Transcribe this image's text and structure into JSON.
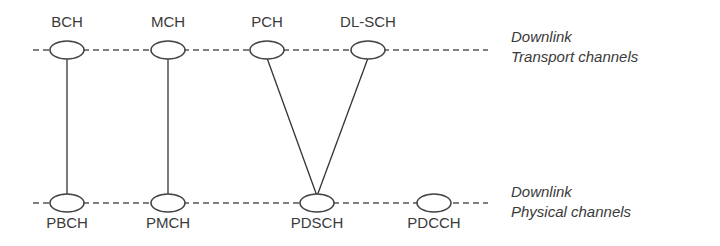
{
  "diagram": {
    "transport_layer": {
      "label_line1": "Downlink",
      "label_line2": "Transport channels",
      "channels": [
        {
          "id": "BCH",
          "label": "BCH"
        },
        {
          "id": "MCH",
          "label": "MCH"
        },
        {
          "id": "PCH",
          "label": "PCH"
        },
        {
          "id": "DL-SCH",
          "label": "DL-SCH"
        }
      ]
    },
    "physical_layer": {
      "label_line1": "Downlink",
      "label_line2": "Physical channels",
      "channels": [
        {
          "id": "PBCH",
          "label": "PBCH"
        },
        {
          "id": "PMCH",
          "label": "PMCH"
        },
        {
          "id": "PDSCH",
          "label": "PDSCH"
        },
        {
          "id": "PDCCH",
          "label": "PDCCH"
        }
      ]
    },
    "mappings": [
      {
        "from": "BCH",
        "to": "PBCH"
      },
      {
        "from": "MCH",
        "to": "PMCH"
      },
      {
        "from": "PCH",
        "to": "PDSCH"
      },
      {
        "from": "DL-SCH",
        "to": "PDSCH"
      }
    ]
  }
}
